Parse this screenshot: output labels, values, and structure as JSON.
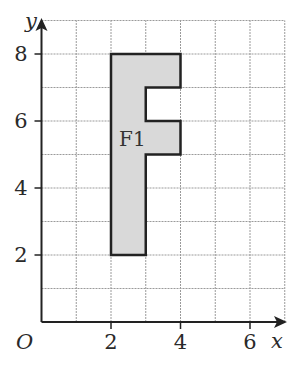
{
  "diagram": {
    "type": "coordinate-grid",
    "x_axis": {
      "label": "x",
      "ticks": [
        "2",
        "4",
        "6"
      ],
      "tick_values": [
        2,
        4,
        6
      ],
      "range": [
        0,
        7
      ]
    },
    "y_axis": {
      "label": "y",
      "ticks": [
        "2",
        "4",
        "6",
        "8"
      ],
      "tick_values": [
        2,
        4,
        6,
        8
      ],
      "range": [
        0,
        9
      ]
    },
    "origin_label": "O",
    "shape": {
      "label": "F1",
      "fill": "#d9d9d9",
      "stroke": "#222222",
      "vertices": [
        [
          2,
          2
        ],
        [
          2,
          8
        ],
        [
          4,
          8
        ],
        [
          4,
          7
        ],
        [
          3,
          7
        ],
        [
          3,
          6
        ],
        [
          4,
          6
        ],
        [
          4,
          5
        ],
        [
          3,
          5
        ],
        [
          3,
          2
        ]
      ]
    }
  }
}
